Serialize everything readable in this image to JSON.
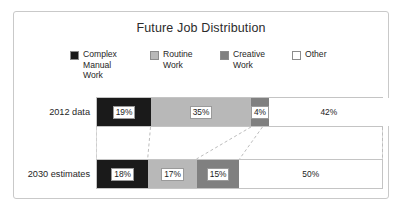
{
  "chart_data": {
    "type": "bar",
    "orientation": "horizontal-stacked",
    "title": "Future Job Distribution",
    "xlabel": "",
    "ylabel": "",
    "categories": [
      "2012 data",
      "2030 estimates"
    ],
    "grid": false,
    "legend_position": "top",
    "xlim": [
      0,
      100
    ],
    "series": [
      {
        "name": "Complex Manual Work",
        "color": "#1a1a1a",
        "values": [
          19,
          18
        ],
        "labels": [
          "19%",
          "18%"
        ]
      },
      {
        "name": "Routine Work",
        "color": "#b8b8b8",
        "values": [
          35,
          17
        ],
        "labels": [
          "35%",
          "17%"
        ]
      },
      {
        "name": "Creative Work",
        "color": "#808080",
        "values": [
          4,
          15
        ],
        "labels": [
          "4%",
          "15%"
        ]
      },
      {
        "name": "Other",
        "color": "#ffffff",
        "values": [
          42,
          50
        ],
        "labels": [
          "42%",
          "50%"
        ]
      }
    ]
  },
  "legend": {
    "items": [
      {
        "label": "Complex\nManual\nWork",
        "color": "#1a1a1a",
        "name": "complex-manual-work"
      },
      {
        "label": "Routine\nWork",
        "color": "#b8b8b8",
        "name": "routine-work"
      },
      {
        "label": "Creative\nWork",
        "color": "#808080",
        "name": "creative-work"
      },
      {
        "label": "Other",
        "color": "#ffffff",
        "name": "other"
      }
    ]
  },
  "rows": [
    {
      "label": "2012 data",
      "segments": [
        {
          "value": "19%",
          "pct": 19,
          "color": "#1a1a1a",
          "series": "Complex Manual Work"
        },
        {
          "value": "35%",
          "pct": 35,
          "color": "#b8b8b8",
          "series": "Routine Work"
        },
        {
          "value": "4%",
          "pct": 4,
          "color": "#808080",
          "series": "Creative Work"
        },
        {
          "value": "42%",
          "pct": 42,
          "color": "#ffffff",
          "series": "Other"
        }
      ]
    },
    {
      "label": "2030 estimates",
      "segments": [
        {
          "value": "18%",
          "pct": 18,
          "color": "#1a1a1a",
          "series": "Complex Manual Work"
        },
        {
          "value": "17%",
          "pct": 17,
          "color": "#b8b8b8",
          "series": "Routine Work"
        },
        {
          "value": "15%",
          "pct": 15,
          "color": "#808080",
          "series": "Creative Work"
        },
        {
          "value": "50%",
          "pct": 50,
          "color": "#ffffff",
          "series": "Other"
        }
      ]
    }
  ],
  "style": {
    "connector_color": "#bdbdbd",
    "frame_border": "#c9c9c9",
    "bar_border": "#c4c4c4"
  }
}
